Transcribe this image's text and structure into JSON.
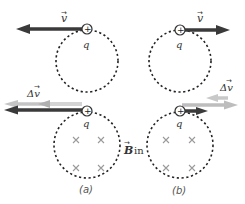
{
  "figure": {
    "labels": {
      "velocity": "v",
      "delta_velocity": "Δv",
      "charge": "q",
      "charge_sign": "+",
      "field_symbol": "B",
      "field_direction": "in",
      "panel_a": "(a)",
      "panel_b": "(b)"
    },
    "colors": {
      "velocity_arrow": "#3a3a3a",
      "old_velocity_arrow": "#b5b5b5",
      "delta_arrow": "#c8c8c8",
      "path": "#222222",
      "field_marks": "#9a9a9a"
    },
    "panels": [
      {
        "id": "a",
        "velocity_direction": "left",
        "field_marks": 4
      },
      {
        "id": "b",
        "velocity_direction": "right",
        "field_marks": 4
      }
    ]
  }
}
